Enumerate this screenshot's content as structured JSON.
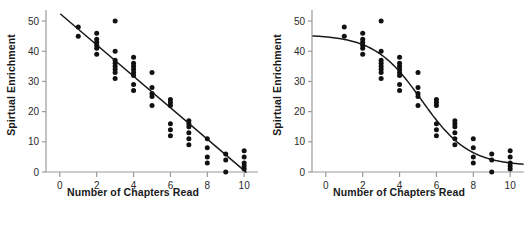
{
  "figure": {
    "background": "#ffffff",
    "point_color": "#111111",
    "line_color": "#1a1a1a",
    "axis_color": "#9a9a9a",
    "tick_label_color": "#2b2b2b"
  },
  "panels": [
    {
      "id": "panel-left",
      "xlabel": "Number of Chapters Read",
      "ylabel": "Spirtual Enrichment",
      "fit_label": "linear"
    },
    {
      "id": "panel-right",
      "xlabel": "Number of Chapters Read",
      "ylabel": "Spirtual Enrichment",
      "fit_label": "sigmoid"
    }
  ],
  "chart_data": [
    {
      "type": "scatter",
      "title": "",
      "xlabel": "Number of Chapters Read",
      "ylabel": "Spirtual Enrichment",
      "xlim": [
        -0.75,
        10.75
      ],
      "ylim": [
        0,
        53
      ],
      "xticks": [
        0,
        2,
        4,
        6,
        8,
        10
      ],
      "yticks": [
        0,
        10,
        20,
        30,
        40,
        50
      ],
      "grid": false,
      "legend": null,
      "points": [
        {
          "x": 1,
          "y": 48
        },
        {
          "x": 1,
          "y": 45
        },
        {
          "x": 2,
          "y": 46
        },
        {
          "x": 2,
          "y": 44
        },
        {
          "x": 2,
          "y": 43
        },
        {
          "x": 2,
          "y": 42
        },
        {
          "x": 2,
          "y": 41
        },
        {
          "x": 2,
          "y": 39
        },
        {
          "x": 3,
          "y": 50
        },
        {
          "x": 3,
          "y": 40
        },
        {
          "x": 3,
          "y": 37
        },
        {
          "x": 3,
          "y": 36
        },
        {
          "x": 3,
          "y": 35
        },
        {
          "x": 3,
          "y": 34
        },
        {
          "x": 3,
          "y": 33
        },
        {
          "x": 3,
          "y": 31
        },
        {
          "x": 4,
          "y": 38
        },
        {
          "x": 4,
          "y": 36
        },
        {
          "x": 4,
          "y": 35
        },
        {
          "x": 4,
          "y": 34
        },
        {
          "x": 4,
          "y": 33
        },
        {
          "x": 4,
          "y": 32
        },
        {
          "x": 4,
          "y": 29
        },
        {
          "x": 4,
          "y": 27
        },
        {
          "x": 5,
          "y": 33
        },
        {
          "x": 5,
          "y": 28
        },
        {
          "x": 5,
          "y": 26
        },
        {
          "x": 5,
          "y": 25
        },
        {
          "x": 5,
          "y": 22
        },
        {
          "x": 6,
          "y": 24
        },
        {
          "x": 6,
          "y": 23
        },
        {
          "x": 6,
          "y": 22
        },
        {
          "x": 6,
          "y": 16
        },
        {
          "x": 6,
          "y": 14
        },
        {
          "x": 6,
          "y": 12
        },
        {
          "x": 7,
          "y": 17
        },
        {
          "x": 7,
          "y": 16
        },
        {
          "x": 7,
          "y": 15
        },
        {
          "x": 7,
          "y": 13
        },
        {
          "x": 7,
          "y": 11
        },
        {
          "x": 7,
          "y": 9
        },
        {
          "x": 8,
          "y": 11
        },
        {
          "x": 8,
          "y": 8
        },
        {
          "x": 8,
          "y": 5
        },
        {
          "x": 8,
          "y": 3
        },
        {
          "x": 9,
          "y": 6
        },
        {
          "x": 9,
          "y": 4
        },
        {
          "x": 9,
          "y": 0
        },
        {
          "x": 10,
          "y": 7
        },
        {
          "x": 10,
          "y": 5
        },
        {
          "x": 10,
          "y": 3
        },
        {
          "x": 10,
          "y": 2
        },
        {
          "x": 10,
          "y": 1
        }
      ],
      "fit": {
        "kind": "linear",
        "description": "straight regression line",
        "intercept": 52.5,
        "slope": -5.2,
        "x_from": 0.05,
        "x_to": 10.1
      }
    },
    {
      "type": "scatter",
      "title": "",
      "xlabel": "Number of Chapters Read",
      "ylabel": "Spirtual Enrichment",
      "xlim": [
        -0.75,
        10.75
      ],
      "ylim": [
        0,
        53
      ],
      "xticks": [
        0,
        2,
        4,
        6,
        8,
        10
      ],
      "yticks": [
        0,
        10,
        20,
        30,
        40,
        50
      ],
      "grid": false,
      "legend": null,
      "points": [
        {
          "x": 1,
          "y": 48
        },
        {
          "x": 1,
          "y": 45
        },
        {
          "x": 2,
          "y": 46
        },
        {
          "x": 2,
          "y": 44
        },
        {
          "x": 2,
          "y": 43
        },
        {
          "x": 2,
          "y": 42
        },
        {
          "x": 2,
          "y": 41
        },
        {
          "x": 2,
          "y": 39
        },
        {
          "x": 3,
          "y": 50
        },
        {
          "x": 3,
          "y": 40
        },
        {
          "x": 3,
          "y": 37
        },
        {
          "x": 3,
          "y": 36
        },
        {
          "x": 3,
          "y": 35
        },
        {
          "x": 3,
          "y": 34
        },
        {
          "x": 3,
          "y": 33
        },
        {
          "x": 3,
          "y": 31
        },
        {
          "x": 4,
          "y": 38
        },
        {
          "x": 4,
          "y": 36
        },
        {
          "x": 4,
          "y": 35
        },
        {
          "x": 4,
          "y": 34
        },
        {
          "x": 4,
          "y": 33
        },
        {
          "x": 4,
          "y": 32
        },
        {
          "x": 4,
          "y": 29
        },
        {
          "x": 4,
          "y": 27
        },
        {
          "x": 5,
          "y": 33
        },
        {
          "x": 5,
          "y": 28
        },
        {
          "x": 5,
          "y": 26
        },
        {
          "x": 5,
          "y": 25
        },
        {
          "x": 5,
          "y": 22
        },
        {
          "x": 6,
          "y": 24
        },
        {
          "x": 6,
          "y": 23
        },
        {
          "x": 6,
          "y": 22
        },
        {
          "x": 6,
          "y": 16
        },
        {
          "x": 6,
          "y": 14
        },
        {
          "x": 6,
          "y": 12
        },
        {
          "x": 7,
          "y": 17
        },
        {
          "x": 7,
          "y": 16
        },
        {
          "x": 7,
          "y": 15
        },
        {
          "x": 7,
          "y": 13
        },
        {
          "x": 7,
          "y": 11
        },
        {
          "x": 7,
          "y": 9
        },
        {
          "x": 8,
          "y": 11
        },
        {
          "x": 8,
          "y": 8
        },
        {
          "x": 8,
          "y": 5
        },
        {
          "x": 8,
          "y": 3
        },
        {
          "x": 9,
          "y": 6
        },
        {
          "x": 9,
          "y": 4
        },
        {
          "x": 9,
          "y": 0
        },
        {
          "x": 10,
          "y": 7
        },
        {
          "x": 10,
          "y": 5
        },
        {
          "x": 10,
          "y": 3
        },
        {
          "x": 10,
          "y": 2
        },
        {
          "x": 10,
          "y": 1
        }
      ],
      "fit": {
        "kind": "sigmoid",
        "description": "S-shaped logistic curve with upper plateau and lower plateau",
        "upper_asymptote": 45.5,
        "lower_asymptote": 2.0,
        "inflection_x": 5.2,
        "steepness": 0.78,
        "x_from": -0.7,
        "x_to": 10.7
      }
    }
  ]
}
